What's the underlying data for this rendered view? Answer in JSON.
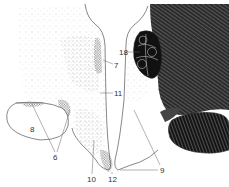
{
  "figure": {
    "type": "anatomical cross-section line drawing",
    "colors": {
      "background": "#ffffff",
      "line": "#555555",
      "stipple": "#444444",
      "dark_tissue": "#1a1a1a",
      "label_text": "#333333"
    },
    "labels": [
      {
        "id": "18",
        "text": "18",
        "x": 120,
        "y": 55
      },
      {
        "id": "7",
        "text": "7",
        "x": 115,
        "y": 67
      },
      {
        "id": "11",
        "text": "11",
        "x": 115,
        "y": 96
      },
      {
        "id": "8",
        "text": "8",
        "x": 31,
        "y": 131
      },
      {
        "id": "6",
        "text": "6",
        "x": 54,
        "y": 158
      },
      {
        "id": "10",
        "text": "10",
        "x": 89,
        "y": 181
      },
      {
        "id": "12",
        "text": "12",
        "x": 110,
        "y": 181
      },
      {
        "id": "9",
        "text": "9",
        "x": 161,
        "y": 172
      }
    ]
  }
}
